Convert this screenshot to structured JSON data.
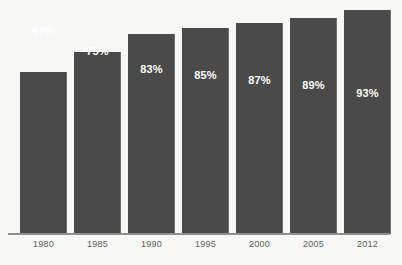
{
  "chart_data": {
    "type": "bar",
    "title": "",
    "title_note": "title row is cropped off the top edge of the screenshot and is illegible",
    "xlabel": "",
    "ylabel": "",
    "categories": [
      "1980",
      "1985",
      "1990",
      "1995",
      "2000",
      "2005",
      "2012"
    ],
    "values": [
      67,
      75,
      83,
      85,
      87,
      89,
      93
    ],
    "value_labels": [
      "67%",
      "75%",
      "83%",
      "85%",
      "87%",
      "89%",
      "93%"
    ],
    "unit": "%",
    "ylim": [
      0,
      100
    ],
    "grid": false,
    "legend": false,
    "legend_position": "none",
    "series": [
      {
        "name": "",
        "values": [
          67,
          75,
          83,
          85,
          87,
          89,
          93
        ]
      }
    ],
    "bar_color": "#4a4a4a",
    "background_color": "#f8f8f6",
    "axis_color": "#8f8f8f",
    "value_label_color": "#ffffff",
    "tick_label_color": "#5d5d5d"
  },
  "bars": [
    {
      "category": "1980",
      "value": 67,
      "label": "67%",
      "x": 20,
      "width": 47,
      "top": 72
    },
    {
      "category": "1985",
      "value": 75,
      "label": "75%",
      "x": 74,
      "width": 47,
      "top": 52
    },
    {
      "category": "1990",
      "value": 83,
      "label": "83%",
      "x": 128,
      "width": 47,
      "top": 34
    },
    {
      "category": "1995",
      "value": 85,
      "label": "85%",
      "x": 182,
      "width": 47,
      "top": 28
    },
    {
      "category": "2000",
      "value": 87,
      "label": "87%",
      "x": 236,
      "width": 47,
      "top": 23
    },
    {
      "category": "2005",
      "value": 89,
      "label": "89%",
      "x": 290,
      "width": 47,
      "top": 18
    },
    {
      "category": "2012",
      "value": 93,
      "label": "93%",
      "x": 344,
      "width": 47,
      "top": 10
    }
  ]
}
